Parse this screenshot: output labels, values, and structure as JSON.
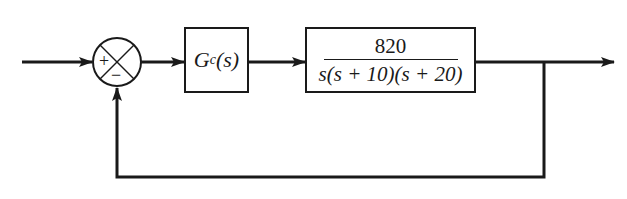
{
  "diagram": {
    "type": "unity-feedback block diagram",
    "colors": {
      "stroke": "#1a1a1a",
      "background": "#ffffff"
    },
    "summing_junction": {
      "plus_sign": "+",
      "minus_sign": "−"
    },
    "controller_block": {
      "symbol": "G",
      "subscript": "c",
      "argument": "(s)"
    },
    "plant_block": {
      "numerator": "820",
      "denominator": "s(s + 10)(s + 20)"
    },
    "signals": [
      "input",
      "error",
      "control",
      "output",
      "feedback"
    ]
  }
}
